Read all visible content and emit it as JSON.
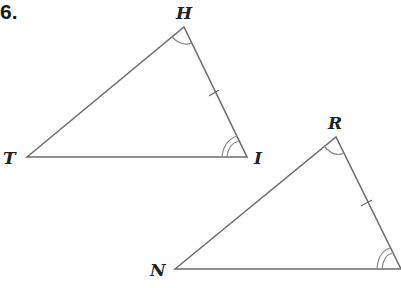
{
  "problem_number": "6.",
  "triangle1": {
    "vertices": {
      "H": "H",
      "I": "I",
      "T": "T"
    },
    "marks": {
      "angle_H": "single arc",
      "angle_I": "double arc",
      "side_HI": "single tick"
    }
  },
  "triangle2": {
    "vertices": {
      "R": "R",
      "N": "N"
    },
    "marks": {
      "angle_R": "single arc",
      "angle_bottom_right": "double arc",
      "side_R_right": "single tick"
    }
  },
  "colors": {
    "stroke": "#6e6e6e",
    "arc": "#8a8a8a",
    "text": "#222222"
  }
}
